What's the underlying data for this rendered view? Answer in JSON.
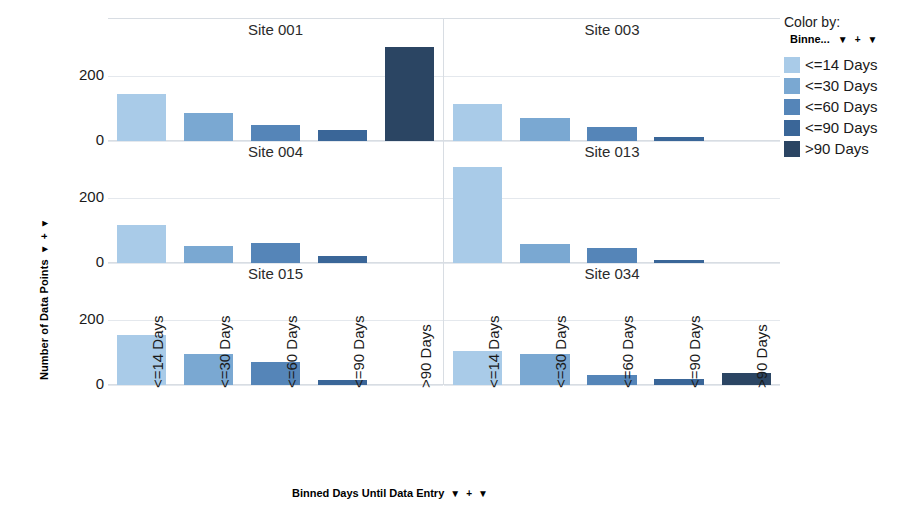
{
  "axes": {
    "y_title": "Number of Data Points",
    "x_title": "Binned Days Until Data Entry",
    "y_ticks": [
      "200",
      "0"
    ],
    "control_caret": "▼",
    "control_plus": "+"
  },
  "legend": {
    "title": "Color by:",
    "field": "Binne...",
    "items": [
      {
        "label": "<=14 Days",
        "color": "#a9cbe8"
      },
      {
        "label": "<=30 Days",
        "color": "#7aa8d2"
      },
      {
        "label": "<=60 Days",
        "color": "#5585b8"
      },
      {
        "label": "<=90 Days",
        "color": "#3a6698"
      },
      {
        "label": ">90 Days",
        "color": "#2b4563"
      }
    ]
  },
  "chart_data": {
    "type": "bar",
    "title": "",
    "subtitle": "",
    "xlabel": "Binned Days Until Data Entry",
    "ylabel": "Number of Data Points",
    "categories": [
      "<=14 Days",
      "<=30 Days",
      "<=60 Days",
      "<=90 Days",
      ">90 Days"
    ],
    "ylim": [
      0,
      310
    ],
    "yticks": [
      0,
      200
    ],
    "grid": true,
    "legend_position": "right",
    "facet_layout": {
      "rows": 3,
      "cols": 2,
      "facet_by": "Site"
    },
    "colors": [
      "#a9cbe8",
      "#7aa8d2",
      "#5585b8",
      "#3a6698",
      "#2b4563"
    ],
    "panels": [
      {
        "title": "Site 001",
        "values": [
          145,
          85,
          48,
          35,
          290
        ],
        "bars": [
          {
            "category": "<=14 Days",
            "value": 145,
            "color": "#a9cbe8"
          },
          {
            "category": "<=30 Days",
            "value": 85,
            "color": "#7aa8d2"
          },
          {
            "category": "<=60 Days",
            "value": 48,
            "color": "#5585b8"
          },
          {
            "category": "<=90 Days",
            "value": 35,
            "color": "#3a6698"
          },
          {
            "category": ">90 Days",
            "value": 290,
            "color": "#2b4563"
          }
        ]
      },
      {
        "title": "Site 003",
        "values": [
          115,
          72,
          42,
          12,
          0
        ],
        "bars": [
          {
            "category": "<=14 Days",
            "value": 115,
            "color": "#a9cbe8"
          },
          {
            "category": "<=30 Days",
            "value": 72,
            "color": "#7aa8d2"
          },
          {
            "category": "<=60 Days",
            "value": 42,
            "color": "#5585b8"
          },
          {
            "category": "<=90 Days",
            "value": 12,
            "color": "#3a6698"
          },
          {
            "category": ">90 Days",
            "value": 0,
            "color": "#2b4563"
          }
        ]
      },
      {
        "title": "Site 004",
        "values": [
          118,
          52,
          62,
          20,
          0
        ],
        "bars": [
          {
            "category": "<=14 Days",
            "value": 118,
            "color": "#a9cbe8"
          },
          {
            "category": "<=30 Days",
            "value": 52,
            "color": "#7aa8d2"
          },
          {
            "category": "<=60 Days",
            "value": 62,
            "color": "#5585b8"
          },
          {
            "category": "<=90 Days",
            "value": 20,
            "color": "#3a6698"
          },
          {
            "category": ">90 Days",
            "value": 0,
            "color": "#2b4563"
          }
        ]
      },
      {
        "title": "Site 013",
        "values": [
          295,
          58,
          45,
          10,
          0
        ],
        "bars": [
          {
            "category": "<=14 Days",
            "value": 295,
            "color": "#a9cbe8"
          },
          {
            "category": "<=30 Days",
            "value": 58,
            "color": "#7aa8d2"
          },
          {
            "category": "<=60 Days",
            "value": 45,
            "color": "#5585b8"
          },
          {
            "category": "<=90 Days",
            "value": 10,
            "color": "#3a6698"
          },
          {
            "category": ">90 Days",
            "value": 0,
            "color": "#2b4563"
          }
        ]
      },
      {
        "title": "Site 015",
        "values": [
          152,
          95,
          72,
          14,
          0
        ],
        "bars": [
          {
            "category": "<=14 Days",
            "value": 152,
            "color": "#a9cbe8"
          },
          {
            "category": "<=30 Days",
            "value": 95,
            "color": "#7aa8d2"
          },
          {
            "category": "<=60 Days",
            "value": 72,
            "color": "#5585b8"
          },
          {
            "category": "<=90 Days",
            "value": 14,
            "color": "#3a6698"
          },
          {
            "category": ">90 Days",
            "value": 0,
            "color": "#2b4563"
          }
        ]
      },
      {
        "title": "Site 034",
        "values": [
          105,
          95,
          30,
          18,
          38
        ],
        "bars": [
          {
            "category": "<=14 Days",
            "value": 105,
            "color": "#a9cbe8"
          },
          {
            "category": "<=30 Days",
            "value": 95,
            "color": "#7aa8d2"
          },
          {
            "category": "<=60 Days",
            "value": 30,
            "color": "#5585b8"
          },
          {
            "category": "<=90 Days",
            "value": 18,
            "color": "#3a6698"
          },
          {
            "category": ">90 Days",
            "value": 38,
            "color": "#2b4563"
          }
        ]
      }
    ]
  }
}
